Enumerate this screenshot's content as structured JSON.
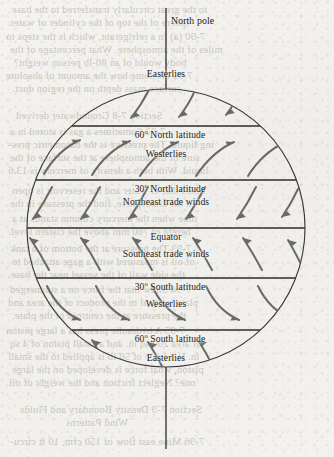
{
  "figure": {
    "type": "global-wind-belts-diagram",
    "pole_labels": {
      "north": "North pole"
    },
    "ink_color": "#2e2d2b",
    "arrow_color": "#6a6967",
    "paper_color": "#f2f1ee"
  },
  "latitude_lines": [
    {
      "id": "lat-60n",
      "degrees": "60",
      "hemisphere": "North",
      "suffix": "latitude",
      "label": "60° North latitude",
      "deg_num": "60",
      "deg_rest": " North latitude"
    },
    {
      "id": "lat-30n",
      "degrees": "30",
      "hemisphere": "North",
      "suffix": "latitude",
      "label": "30° North latitude",
      "deg_num": "30",
      "deg_rest": " North latitude"
    },
    {
      "id": "equator",
      "degrees": "0",
      "hemisphere": "",
      "suffix": "",
      "label": "Equator",
      "deg_num": "",
      "deg_rest": "Equator"
    },
    {
      "id": "lat-30s",
      "degrees": "30",
      "hemisphere": "South",
      "suffix": "latitude",
      "label": "30° South latitude",
      "deg_num": "30",
      "deg_rest": " South latitude"
    },
    {
      "id": "lat-60s",
      "degrees": "60",
      "hemisphere": "South",
      "suffix": "latitude",
      "label": "60° South latitude",
      "deg_num": "60",
      "deg_rest": " South latitude"
    }
  ],
  "wind_belts": [
    {
      "id": "polar-easterlies-north",
      "label": "Easterlies"
    },
    {
      "id": "westerlies-north",
      "label": "Westerlies"
    },
    {
      "id": "northeast-trades",
      "label": "Northeast trade winds"
    },
    {
      "id": "southeast-trades",
      "label": "Southeast trade winds"
    },
    {
      "id": "westerlies-south",
      "label": "Westerlies"
    },
    {
      "id": "polar-easterlies-south",
      "label": "Easterlies"
    }
  ],
  "bleed_through_lines": [
    {
      "text": "to the great circularly transferred to the base",
      "x": 12,
      "y": 4,
      "size": 10.5
    },
    {
      "text": "sphere of the top of the cylinder of water.",
      "x": 8,
      "y": 17,
      "size": 10.5
    },
    {
      "text": "7-90   (a) In a refrigerant, which is the steps to",
      "x": 6,
      "y": 31,
      "size": 10.5
    },
    {
      "text": "miles of the atmosphere. What percentage of the",
      "x": 10,
      "y": 44,
      "size": 10.5
    },
    {
      "text": "body would of an 80-lb person weight?",
      "x": 14,
      "y": 57,
      "size": 10.5
    },
    {
      "text": "7-91    Dx  some how  the  amount  of  absolute",
      "x": 6,
      "y": 70,
      "size": 10.5
    },
    {
      "text": "surface mass depth on the region duct.",
      "x": 12,
      "y": 83,
      "size": 10.5
    },
    {
      "text": "Section 7-8 Groundwater derived",
      "x": 16,
      "y": 110,
      "size": 10.5
    },
    {
      "text": "7-92  Sometimes a gas is stored in a",
      "x": 10,
      "y": 126,
      "size": 10.5
    },
    {
      "text": "ing liquid. The pressure is the barometric pres-",
      "x": 8,
      "y": 139,
      "size": 10.5
    },
    {
      "text": "sure of the atmosphere at the surface of the",
      "x": 10,
      "y": 152,
      "size": 10.5
    },
    {
      "text": "liquid. With both a density of mercury is 13.6",
      "x": 8,
      "y": 165,
      "size": 10.5
    },
    {
      "text": "times that of water and the reservoir is open",
      "x": 12,
      "y": 185,
      "size": 10.5
    },
    {
      "text": "to the atmosphere, find the pressure in the",
      "x": 10,
      "y": 198,
      "size": 10.5
    },
    {
      "text": "tube when the mercury column stands at a",
      "x": 12,
      "y": 213,
      "size": 10.5
    },
    {
      "text": "height of 760 mm above the cistern level.",
      "x": 8,
      "y": 226,
      "size": 10.5
    },
    {
      "text": "7-93  The pressure at the bottom of a tank",
      "x": 10,
      "y": 243,
      "size": 10.5
    },
    {
      "text": "of oil is measured with a gage attached to",
      "x": 12,
      "y": 256,
      "size": 10.5
    },
    {
      "text": "the side wall of the vessel near the base.",
      "x": 8,
      "y": 269,
      "size": 10.5
    },
    {
      "text": "7-94  Show that the force on a submerged",
      "x": 10,
      "y": 284,
      "size": 10.5
    },
    {
      "text": "plate is equal to the product of the area and",
      "x": 8,
      "y": 297,
      "size": 10.5
    },
    {
      "text": "the pressure at the centroid of the plate.",
      "x": 12,
      "y": 310,
      "size": 10.5
    },
    {
      "text": "7-95  A hydraulic press has a large piston",
      "x": 6,
      "y": 325,
      "size": 10.5
    },
    {
      "text": "of area 200 sq in. and a small piston of 4 sq",
      "x": 10,
      "y": 338,
      "size": 10.5
    },
    {
      "text": "in. If a force of 50 lb is applied to the small",
      "x": 8,
      "y": 351,
      "size": 10.5
    },
    {
      "text": "piston, what force is developed on the large",
      "x": 12,
      "y": 364,
      "size": 10.5
    },
    {
      "text": "one? Neglect friction and the weight of oil.",
      "x": 6,
      "y": 377,
      "size": 10.5
    },
    {
      "text": "Section 7-9 Density Boundary and Fluids",
      "x": 20,
      "y": 404,
      "size": 10.5
    },
    {
      "text": "Wind Patterns",
      "x": 66,
      "y": 417,
      "size": 10.5
    },
    {
      "text": "7-96  Mine east flow of 150 cfm, 10 ft circu-",
      "x": 10,
      "y": 436,
      "size": 10.5
    }
  ]
}
